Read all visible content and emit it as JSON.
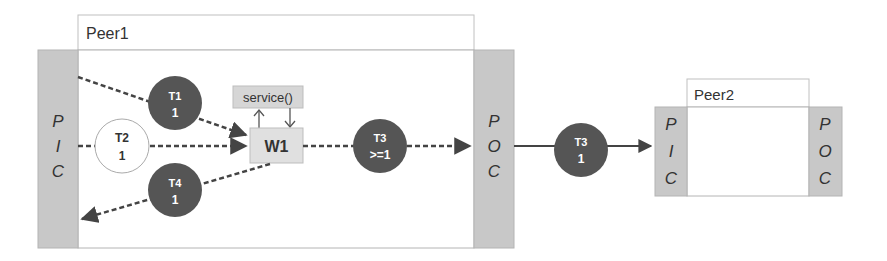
{
  "diagram": {
    "type": "architecture-flow",
    "colors": {
      "port_fill": "#c8c8c8",
      "token_fill": "#555555",
      "token_text": "#ffffff",
      "box_fill": "#dedede",
      "line": "#444444",
      "border": "#b4b4b4"
    },
    "peers": [
      {
        "name": "Peer1",
        "input_port": [
          "P",
          "I",
          "C"
        ],
        "output_port": [
          "P",
          "O",
          "C"
        ]
      },
      {
        "name": "Peer2",
        "input_port": [
          "P",
          "I",
          "C"
        ],
        "output_port": [
          "P",
          "O",
          "C"
        ]
      }
    ],
    "service_box": "service()",
    "worker": "W1",
    "tokens": [
      {
        "id": "T1",
        "count": "1",
        "style": "filled",
        "edge": "PIC -> W1 (dashed)"
      },
      {
        "id": "T2",
        "count": "1",
        "style": "outline",
        "edge": "PIC -> W1 (dashed)"
      },
      {
        "id": "T4",
        "count": "1",
        "style": "filled",
        "edge": "W1 -> PIC (dashed)"
      },
      {
        "id": "T3",
        "count": ">=1",
        "style": "filled",
        "edge": "W1 -> POC (dashed)"
      },
      {
        "id": "T3",
        "count": "1",
        "style": "filled",
        "edge": "Peer1 POC -> Peer2 PIC (solid)"
      }
    ]
  }
}
